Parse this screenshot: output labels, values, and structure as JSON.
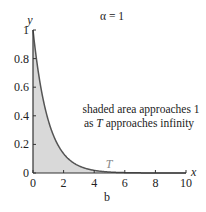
{
  "chart_data": {
    "type": "area",
    "title": "α = 1",
    "subtitle_label": "b",
    "xlabel": "x",
    "ylabel": "y",
    "xlim": [
      0,
      10
    ],
    "ylim": [
      0,
      1
    ],
    "x_ticks": [
      0,
      2,
      4,
      6,
      8,
      10
    ],
    "x_tick_labels": [
      "0",
      "2",
      "4",
      "6",
      "8",
      "10"
    ],
    "y_ticks": [
      0,
      0.2,
      0.4,
      0.6,
      0.8,
      1
    ],
    "y_tick_labels": [
      "0",
      "0.2",
      "0.4",
      "0.6",
      "0.8",
      "1"
    ],
    "grid": false,
    "series": [
      {
        "name": "y = α·e^(−αx)",
        "function": "exp_decay",
        "alpha": 1,
        "x_range": [
          0,
          10
        ]
      }
    ],
    "shaded_region": {
      "x_from": 0,
      "x_to": 5,
      "color": "#d9d9d9"
    },
    "marker_T": {
      "x": 5,
      "label": "T"
    },
    "annotation": {
      "line1": "shaded area approaches 1",
      "line2_prefix": "as ",
      "line2_var": "T",
      "line2_suffix": " approaches infinity"
    },
    "colors": {
      "curve": "#555555",
      "axis": "#333333",
      "shade": "#d9d9d9",
      "T_label": "#888888"
    }
  }
}
